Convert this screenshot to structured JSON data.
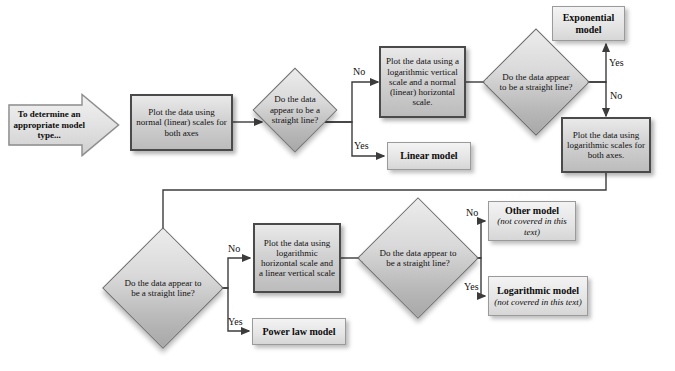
{
  "diagram": {
    "start": {
      "label": "To determine an appropriate model type..."
    },
    "nodes": [
      {
        "id": "plot-normal",
        "type": "process",
        "text": "Plot the data using normal (linear) scales for both axes"
      },
      {
        "id": "decision-1",
        "type": "decision",
        "text": "Do the data appear to be a straight line?"
      },
      {
        "id": "linear-model",
        "type": "result",
        "title": "Linear model",
        "sub": ""
      },
      {
        "id": "plot-log-vertical",
        "type": "process",
        "text": "Plot the data using a logarithmic vertical scale and a normal (linear) horizontal scale."
      },
      {
        "id": "decision-2",
        "type": "decision",
        "text": "Do the data appear to be a straight line?"
      },
      {
        "id": "exponential-model",
        "type": "result",
        "title": "Exponential model",
        "sub": ""
      },
      {
        "id": "plot-log-both",
        "type": "process",
        "text": "Plot the data using logarithmic scales for both axes."
      },
      {
        "id": "decision-3",
        "type": "decision",
        "text": "Do the data appear to be a straight line?"
      },
      {
        "id": "power-law-model",
        "type": "result",
        "title": "Power law model",
        "sub": ""
      },
      {
        "id": "plot-log-horizontal",
        "type": "process",
        "text": "Plot the data using logarithmic horizontal scale and a linear vertical scale"
      },
      {
        "id": "decision-4",
        "type": "decision",
        "text": "Do the data appear to be a straight line?"
      },
      {
        "id": "other-model",
        "type": "result",
        "title": "Other model",
        "sub": "(not covered in this text)"
      },
      {
        "id": "logarithmic-model",
        "type": "result",
        "title": "Logarithmic model",
        "sub": "(not covered in this text)"
      }
    ],
    "edge_labels": {
      "d1_no": "No",
      "d1_yes": "Yes",
      "d2_yes": "Yes",
      "d2_no": "No",
      "d3_no": "No",
      "d3_yes": "Yes",
      "d4_no": "No",
      "d4_yes": "Yes"
    },
    "colors": {
      "process_border": "#4a4a4a",
      "result_border": "#9a9a9a",
      "line": "#3c3c3c",
      "text": "#111111",
      "background": "#ffffff"
    }
  }
}
